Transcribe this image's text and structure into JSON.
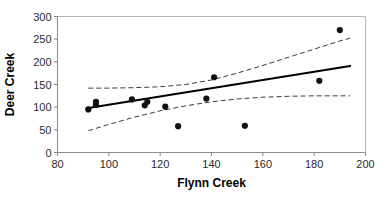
{
  "chart_data": {
    "type": "scatter",
    "title": "",
    "xlabel": "Flynn Creek",
    "ylabel": "Deer Creek",
    "xlim": [
      80,
      200
    ],
    "ylim": [
      0,
      300
    ],
    "xticks": [
      80,
      100,
      120,
      140,
      160,
      180,
      200
    ],
    "yticks": [
      0,
      50,
      100,
      150,
      200,
      250,
      300
    ],
    "xtick_labels": [
      "80",
      "100",
      "120",
      "140",
      "160",
      "180",
      "200"
    ],
    "ytick_labels": [
      "0",
      "50",
      "100",
      "150",
      "200",
      "250",
      "300"
    ],
    "grid": false,
    "legend": false,
    "legend_position": "none",
    "point_color": "#111111",
    "fit_line_color": "#000000",
    "confidence_band_color": "#3a3a3a",
    "axis_color": "#8c8c8c",
    "points": [
      {
        "x": 92,
        "y": 95
      },
      {
        "x": 95,
        "y": 105
      },
      {
        "x": 95,
        "y": 112
      },
      {
        "x": 109,
        "y": 117
      },
      {
        "x": 114,
        "y": 104
      },
      {
        "x": 115,
        "y": 112
      },
      {
        "x": 122,
        "y": 101
      },
      {
        "x": 127,
        "y": 58
      },
      {
        "x": 138,
        "y": 119
      },
      {
        "x": 141,
        "y": 166
      },
      {
        "x": 153,
        "y": 59
      },
      {
        "x": 182,
        "y": 158
      },
      {
        "x": 190,
        "y": 270
      }
    ],
    "series": [
      {
        "name": "Regression line",
        "style": "solid",
        "x": [
          92,
          194
        ],
        "values": [
          98,
          191
        ]
      },
      {
        "name": "Upper confidence band",
        "style": "dashed",
        "x": [
          92,
          100,
          110,
          120,
          130,
          140,
          150,
          160,
          170,
          180,
          190,
          194
        ],
        "values": [
          142,
          142,
          143,
          145,
          150,
          160,
          175,
          192,
          210,
          228,
          246,
          252
        ]
      },
      {
        "name": "Lower confidence band",
        "style": "dashed",
        "x": [
          92,
          100,
          110,
          120,
          130,
          140,
          150,
          160,
          170,
          180,
          190,
          194
        ],
        "values": [
          48,
          62,
          78,
          92,
          103,
          112,
          118,
          122,
          124,
          125,
          125,
          125
        ]
      }
    ]
  },
  "axes": {
    "y_title": "Deer Creek",
    "x_title": "Flynn Creek"
  }
}
